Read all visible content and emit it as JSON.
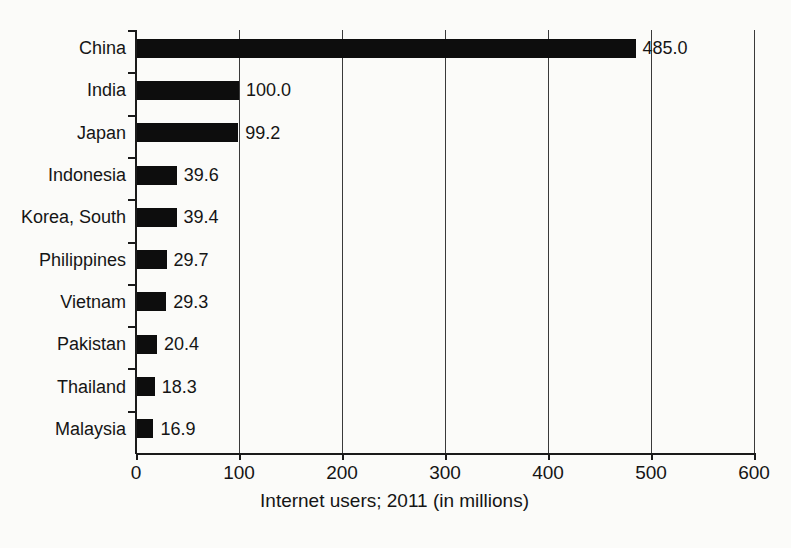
{
  "chart_data": {
    "type": "bar",
    "orientation": "horizontal",
    "title": "",
    "xlabel": "Internet users; 2011 (in millions)",
    "ylabel": "",
    "xlim": [
      0,
      600
    ],
    "xticks": [
      0,
      100,
      200,
      300,
      400,
      500,
      600
    ],
    "xtick_labels": [
      "0",
      "100",
      "200",
      "300",
      "400",
      "500",
      "600"
    ],
    "grid": "vertical gridlines at each x tick",
    "legend": "none",
    "bar_color": "#0d0d0d",
    "background_color": "#fbfbf9",
    "categories": [
      "China",
      "India",
      "Japan",
      "Indonesia",
      "Korea, South",
      "Philippines",
      "Vietnam",
      "Pakistan",
      "Thailand",
      "Malaysia"
    ],
    "values": [
      485.0,
      100.0,
      99.2,
      39.6,
      39.4,
      29.7,
      29.3,
      20.4,
      18.3,
      16.9
    ],
    "value_labels": [
      "485.0",
      "100.0",
      "99.2",
      "39.6",
      "39.4",
      "29.7",
      "29.3",
      "20.4",
      "18.3",
      "16.9"
    ]
  }
}
